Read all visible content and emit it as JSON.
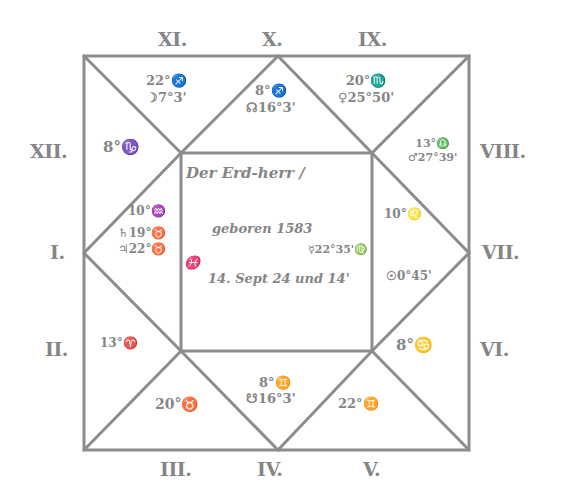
{
  "chart": {
    "line_color": "#8c8c8c",
    "background": "#ffffff",
    "house_labels": {
      "I": "I.",
      "II": "II.",
      "III": "III.",
      "IV": "IV.",
      "V": "V.",
      "VI": "VI.",
      "VII": "VII.",
      "VIII": "VIII.",
      "IX": "IX.",
      "X": "X.",
      "XI": "XI.",
      "XII": "XII."
    },
    "houses": {
      "X": {
        "line1": "8°♐",
        "line2": "☊16°3'"
      },
      "XI": {
        "line1": "22°♐",
        "line2": "☽7°3'"
      },
      "IX": {
        "line1": "20°♏",
        "line2": "♀25°50'"
      },
      "XII": {
        "line1": "8°♑",
        "line2": ""
      },
      "VIII": {
        "line1": "13°♎",
        "line2": "♂27°39'"
      },
      "I": {
        "line1": "10°♒",
        "line2": "♄19°♉",
        "line3": "♃22°♉"
      },
      "VII": {
        "line1": "10°♌",
        "line2": "☿22°35'♍",
        "line3": "☉0°45'"
      },
      "II": {
        "line1": "13°♈",
        "line2": ""
      },
      "VI": {
        "line1": "8°♋",
        "line2": ""
      },
      "III": {
        "line1": "20°♉",
        "line2": ""
      },
      "IV": {
        "line1": "8°♊",
        "line2": "☋16°3'"
      },
      "V": {
        "line1": "22°♊",
        "line2": ""
      }
    },
    "center": {
      "line1": "Der Erd-herr /",
      "line2": "geboren 1583",
      "line3": "14. Sept 24 und 14'",
      "left_mark": "♓"
    }
  }
}
